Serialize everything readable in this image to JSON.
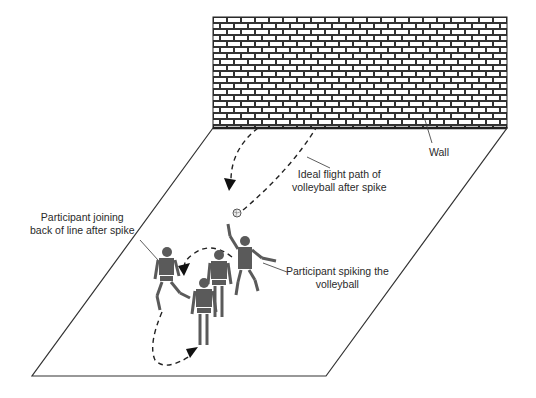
{
  "labels": {
    "wall": "Wall",
    "flight_path_line1": "Ideal flight path of",
    "flight_path_line2": "volleyball after spike",
    "joining_line1": "Participant joining",
    "joining_line2": "back of line after spike",
    "spiking_line1": "Participant spiking the",
    "spiking_line2": "volleyball"
  },
  "colors": {
    "line": "#222222",
    "figure": "#5a5a5a",
    "wall_mortar": "#333333",
    "background": "#ffffff"
  }
}
